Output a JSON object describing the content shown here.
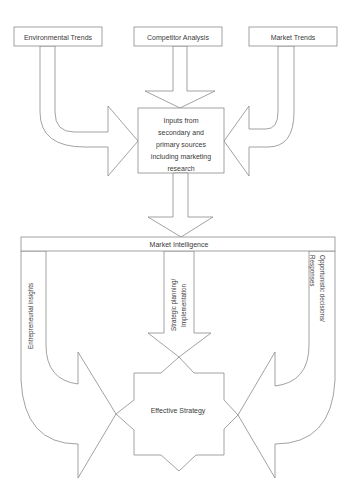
{
  "diagram": {
    "top_boxes": [
      {
        "label": "Environmental Trends"
      },
      {
        "label": "Competitor Analysis"
      },
      {
        "label": "Market Trends"
      }
    ],
    "central_box": {
      "lines": [
        "Inputs from",
        "secondary and",
        "primary sources",
        "including marketing",
        "research"
      ]
    },
    "bar": {
      "label": "Market Intelligence"
    },
    "columns": {
      "left": {
        "label": "Entrepreneurial insights"
      },
      "center": {
        "lines": [
          "Strategic planning/",
          "Implementation"
        ]
      },
      "right": {
        "lines": [
          "Opportunistic decisions/",
          "Responses"
        ]
      }
    },
    "outcome": {
      "label": "Effective Strategy"
    },
    "colors": {
      "stroke": "#8a8a8a",
      "text": "#3a3a3a",
      "fill": "#ffffff"
    }
  }
}
